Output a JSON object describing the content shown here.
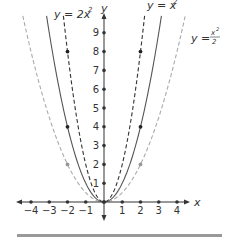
{
  "chart_data": {
    "type": "line",
    "title": "",
    "xlabel": "x",
    "ylabel": "y",
    "xlim": [
      -4.3,
      4.3
    ],
    "ylim": [
      -0.7,
      9.8
    ],
    "grid": false,
    "x_ticks": [
      -4,
      -3,
      -2,
      -1,
      1,
      2,
      3,
      4
    ],
    "x_tick_labels": [
      "−4",
      "−3",
      "−2",
      "−1",
      "1",
      "2",
      "3",
      "4"
    ],
    "y_ticks": [
      1,
      2,
      3,
      4,
      5,
      6,
      7,
      8,
      9
    ],
    "y_tick_labels": [
      "1",
      "2",
      "3",
      "4",
      "5",
      "6",
      "7",
      "8",
      "9"
    ],
    "series": [
      {
        "name": "y = 2x^2",
        "label": "y = 2x",
        "label_sup": "2",
        "style": "dashed",
        "color": "#333333",
        "marked_points": [
          [
            -2,
            8
          ],
          [
            2,
            8
          ],
          [
            0,
            0
          ]
        ],
        "x": [
          -2.2,
          -2,
          -1.5,
          -1,
          -0.5,
          0,
          0.5,
          1,
          1.5,
          2,
          2.2
        ],
        "values": [
          9.68,
          8,
          4.5,
          2,
          0.5,
          0,
          0.5,
          2,
          4.5,
          8,
          9.68
        ]
      },
      {
        "name": "y = x^2",
        "label": "y = x",
        "label_sup": "2",
        "style": "solid",
        "color": "#555555",
        "marked_points": [
          [
            -2,
            4
          ],
          [
            2,
            4
          ],
          [
            0,
            0
          ]
        ],
        "x": [
          -3.1,
          -3,
          -2,
          -1,
          0,
          1,
          2,
          3,
          3.1
        ],
        "values": [
          9.61,
          9,
          4,
          1,
          0,
          1,
          4,
          9,
          9.61
        ]
      },
      {
        "name": "y = x^2/2",
        "label": "y =",
        "label_num": "x²",
        "label_den": "2",
        "style": "dashed",
        "color": "#aaaaaa",
        "marked_points": [
          [
            -2,
            2
          ],
          [
            2,
            2
          ],
          [
            0,
            0
          ]
        ],
        "x": [
          -4.2,
          -4,
          -3,
          -2,
          -1,
          0,
          1,
          2,
          3,
          4,
          4.2
        ],
        "values": [
          8.82,
          8,
          4.5,
          2,
          0.5,
          0,
          0.5,
          2,
          4.5,
          8,
          8.82
        ]
      }
    ],
    "annotations": [
      "y = 2x²",
      "y = x²",
      "y = x²/2"
    ]
  },
  "axis": {
    "x_label": "x",
    "y_label": "y"
  },
  "labels": {
    "s1_main": "y = 2x",
    "s1_sup": "2",
    "s2_main": "y = x",
    "s2_sup": "2",
    "s3_main": "y =",
    "s3_num": "x",
    "s3_num_sup": "2",
    "s3_den": "2"
  },
  "colors": {
    "axis": "#333333",
    "bottom_bar": "#999999"
  }
}
